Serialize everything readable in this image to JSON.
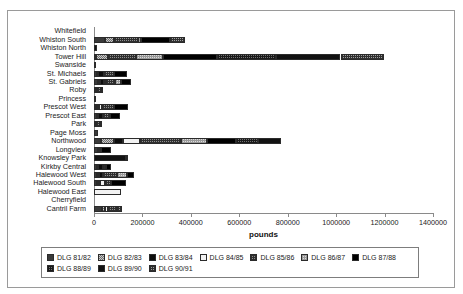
{
  "axis": {
    "x_title": "pounds",
    "x_ticks": [
      "0",
      "200000",
      "400000",
      "600000",
      "800000",
      "1000000",
      "1200000",
      "1400000"
    ]
  },
  "legend": {
    "row1": [
      {
        "label": "DLG 81/82",
        "swatch": "p0"
      },
      {
        "label": "DLG 82/83",
        "swatch": "p1"
      },
      {
        "label": "DLG 83/84",
        "swatch": "p2"
      },
      {
        "label": "DLG 84/85",
        "swatch": "p3"
      },
      {
        "label": "DLG 85/86",
        "swatch": "p4"
      },
      {
        "label": "DLG 86/87",
        "swatch": "p5"
      },
      {
        "label": "DLG 87/88",
        "swatch": "p6"
      }
    ],
    "row2": [
      {
        "label": "DLG 88/89",
        "swatch": "p7"
      },
      {
        "label": "DLG 89/90",
        "swatch": "p8"
      },
      {
        "label": "DLG 90/91",
        "swatch": "p9"
      }
    ]
  },
  "chart_data": {
    "type": "bar",
    "orientation": "horizontal",
    "stacked": true,
    "title": "",
    "xlabel": "pounds",
    "ylabel": "",
    "xlim": [
      0,
      1400000
    ],
    "xticks": [
      0,
      200000,
      400000,
      600000,
      800000,
      1000000,
      1200000,
      1400000
    ],
    "grid": false,
    "legend_position": "bottom",
    "categories": [
      "Whitefield",
      "Whiston South",
      "Whiston North",
      "Tower Hill",
      "Swanside",
      "St. Michaels",
      "St. Gabriels",
      "Roby",
      "Princess",
      "Prescot West",
      "Prescot East",
      "Park",
      "Page Moss",
      "Northwood",
      "Longview",
      "Knowsley Park",
      "Kirkby Central",
      "Halewood West",
      "Halewood South",
      "Halewood East",
      "Cherryfield",
      "Cantril Farm"
    ],
    "series": [
      {
        "name": "DLG 81/82",
        "swatch": "p0",
        "values": [
          0,
          47000,
          0,
          10000,
          0,
          12000,
          15000,
          9000,
          6000,
          10000,
          12000,
          5000,
          16000,
          27000,
          18000,
          0,
          12000,
          13000,
          14000,
          0,
          0,
          34000
        ]
      },
      {
        "name": "DLG 82/83",
        "swatch": "p1",
        "values": [
          0,
          36000,
          0,
          46000,
          0,
          6000,
          9000,
          4000,
          0,
          5000,
          6000,
          4000,
          0,
          57000,
          5000,
          0,
          4000,
          8000,
          4000,
          0,
          0,
          10000
        ]
      },
      {
        "name": "DLG 83/84",
        "swatch": "p2",
        "values": [
          0,
          0,
          0,
          0,
          0,
          22000,
          17000,
          0,
          0,
          6000,
          21000,
          0,
          0,
          36000,
          0,
          0,
          23000,
          16000,
          7000,
          0,
          0,
          0
        ]
      },
      {
        "name": "DLG 84/85",
        "swatch": "p3",
        "values": [
          0,
          0,
          0,
          0,
          0,
          0,
          9000,
          0,
          0,
          14000,
          0,
          0,
          0,
          70000,
          0,
          0,
          0,
          0,
          22000,
          113000,
          0,
          13000
        ]
      },
      {
        "name": "DLG 85/86",
        "swatch": "p4",
        "values": [
          0,
          97000,
          0,
          118000,
          0,
          42000,
          37000,
          15000,
          0,
          49000,
          26000,
          16000,
          0,
          168000,
          7000,
          0,
          11000,
          56000,
          22000,
          0,
          0,
          37000
        ]
      },
      {
        "name": "DLG 86/87",
        "swatch": "p5",
        "values": [
          0,
          15000,
          0,
          112000,
          0,
          0,
          25000,
          0,
          0,
          0,
          0,
          0,
          0,
          107000,
          0,
          0,
          0,
          43000,
          0,
          0,
          0,
          0
        ]
      },
      {
        "name": "DLG 87/88",
        "swatch": "p6",
        "values": [
          0,
          118000,
          0,
          223000,
          0,
          56000,
          40000,
          0,
          0,
          57000,
          44000,
          0,
          0,
          122000,
          40000,
          0,
          22000,
          30000,
          62000,
          0,
          0,
          0
        ]
      },
      {
        "name": "DLG 88/89",
        "swatch": "p7",
        "values": [
          0,
          0,
          0,
          244000,
          0,
          0,
          0,
          0,
          0,
          0,
          0,
          0,
          0,
          89000,
          0,
          0,
          0,
          0,
          0,
          0,
          0,
          0
        ]
      },
      {
        "name": "DLG 89/90",
        "swatch": "p8",
        "values": [
          0,
          0,
          12000,
          265000,
          10000,
          0,
          0,
          0,
          0,
          0,
          0,
          0,
          0,
          98000,
          0,
          132000,
          0,
          0,
          0,
          0,
          0,
          0
        ]
      },
      {
        "name": "DLG 90/91",
        "swatch": "p9",
        "values": [
          0,
          62000,
          0,
          181000,
          0,
          0,
          0,
          9000,
          0,
          0,
          0,
          8000,
          0,
          0,
          0,
          6000,
          0,
          0,
          0,
          0,
          0,
          22000
        ]
      }
    ]
  }
}
